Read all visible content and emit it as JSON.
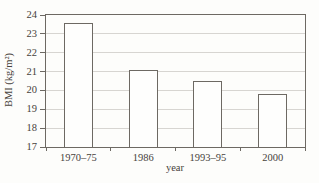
{
  "chart_data": {
    "type": "bar",
    "categories": [
      "1970–75",
      "1986",
      "1993–95",
      "2000"
    ],
    "values": [
      23.6,
      21.1,
      20.5,
      19.8
    ],
    "title": "",
    "xlabel": "year",
    "ylabel": "BMI (kg/m²)",
    "ylim": [
      17,
      24
    ],
    "yticks": [
      17,
      18,
      19,
      20,
      21,
      22,
      23,
      24
    ],
    "grid": true,
    "legend": false,
    "colors": {
      "bar_fill": "#fefefd",
      "bar_border": "#6d6963",
      "axis": "#6d6963",
      "gridline": "#d7d5d1",
      "text": "#47423b",
      "background": "#fdfdfb"
    }
  }
}
